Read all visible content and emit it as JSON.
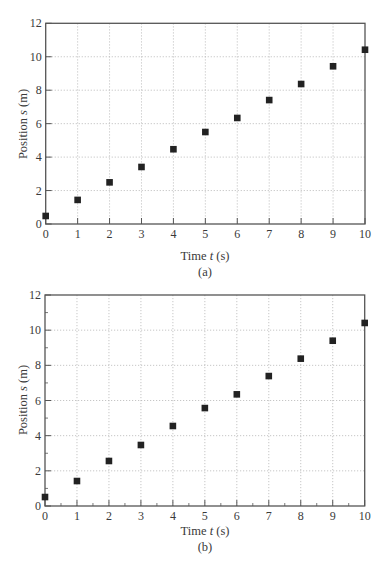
{
  "chart_data": [
    {
      "type": "scatter",
      "panel_label": "(a)",
      "title": "",
      "xlabel": "Time t (s)",
      "ylabel": "Position s (m)",
      "xlim": [
        0,
        10
      ],
      "ylim": [
        0,
        12
      ],
      "x_ticks": [
        0,
        1,
        2,
        3,
        4,
        5,
        6,
        7,
        8,
        9,
        10
      ],
      "y_ticks": [
        0,
        2,
        4,
        6,
        8,
        10,
        12
      ],
      "grid": "dotted",
      "legend": "none",
      "marker": "square",
      "series": [
        {
          "name": "position",
          "x": [
            0,
            1,
            2,
            3,
            4,
            5,
            6,
            7,
            8,
            9,
            10
          ],
          "y": [
            0.48,
            1.44,
            2.49,
            3.41,
            4.47,
            5.5,
            6.34,
            7.41,
            8.37,
            9.43,
            10.42
          ]
        }
      ]
    },
    {
      "type": "scatter",
      "panel_label": "(b)",
      "title": "",
      "xlabel": "Time t (s)",
      "ylabel": "Position s (m)",
      "xlim": [
        0,
        10
      ],
      "ylim": [
        0,
        12
      ],
      "x_ticks": [
        0,
        1,
        2,
        3,
        4,
        5,
        6,
        7,
        8,
        9,
        10
      ],
      "y_ticks": [
        0,
        2,
        4,
        6,
        8,
        10,
        12
      ],
      "grid": "dotted",
      "legend": "none",
      "marker": "square",
      "minor_ticks": true,
      "series": [
        {
          "name": "position",
          "x": [
            0,
            1,
            2,
            3,
            4,
            5,
            6,
            7,
            8,
            9,
            10
          ],
          "y": [
            0.51,
            1.42,
            2.56,
            3.47,
            4.55,
            5.57,
            6.35,
            7.39,
            8.38,
            9.4,
            10.41
          ]
        }
      ]
    }
  ],
  "panels": {
    "a": {
      "xlabel_prefix": "Time ",
      "xlabel_var": "t",
      "xlabel_unit": " (s)",
      "ylabel_prefix": "Position ",
      "ylabel_var": "s",
      "ylabel_unit": " (m)",
      "caption": "(a)"
    },
    "b": {
      "xlabel_prefix": "Time ",
      "xlabel_var": "t",
      "xlabel_unit": " (s)",
      "ylabel_prefix": "Position ",
      "ylabel_var": "s",
      "ylabel_unit": " (m)",
      "caption": "(b)"
    }
  },
  "colors": {
    "marker": "#222222",
    "frame": "#555555",
    "grid": "#b8b8b8",
    "text": "#3a3a3a"
  }
}
